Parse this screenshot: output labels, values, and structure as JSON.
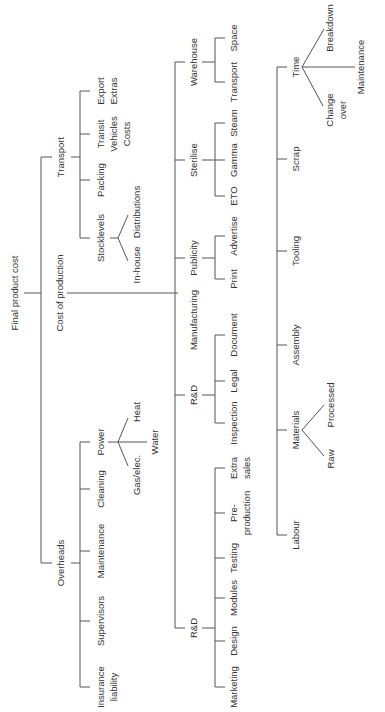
{
  "diagram": {
    "type": "tree",
    "orientation": "rotated-90-ccw",
    "root": "Final product cost",
    "nodes": {
      "root": "Final product cost",
      "cost_of_production": "Cost of production",
      "transport": "Transport",
      "stocklevels": "Stocklevels",
      "in_house": "In-house",
      "distributions": "Distributions",
      "packing": "Packing",
      "transit_vehicles_costs": [
        "Transit",
        "Vehicles",
        "Costs"
      ],
      "export_extras": [
        "Export",
        "Extras"
      ],
      "overheads": "Overheads",
      "insurance_liability": [
        "Insurance",
        "liability"
      ],
      "supervisors": "Supervisors",
      "maintenance": "Maintenance",
      "cleaning": "Cleaning",
      "power": "Power",
      "gas_elec": "Gas/elec.",
      "water": "Water",
      "heat": "Heat",
      "manufacturing": "Manufacturing",
      "warehouse": "Warehouse",
      "wh_transport": "Transport",
      "wh_space": "Space",
      "sterilise": "Sterilise",
      "eto": "ETO",
      "gamma": "Gamma",
      "steam": "Steam",
      "publicity": "Publicity",
      "print": "Print",
      "advertise": "Advertise",
      "rd_upper": "R&D",
      "inspection": "Inspection",
      "legal": "Legal",
      "document": "Document",
      "rd_lower": "R&D",
      "marketing": "Marketing",
      "design": "Design",
      "modules": "Modules",
      "testing": "Testing",
      "pre_production": [
        "Pre-",
        "production"
      ],
      "extra_sales": [
        "Extra",
        "sales"
      ],
      "time": "Time",
      "change_over": [
        "Change",
        "over"
      ],
      "time_maintenance": "Maintenance",
      "breakdown": "Breakdown",
      "scrap": "Scrap",
      "tooling": "Tooling",
      "assembly": "Assembly",
      "materials": "Materials",
      "raw": "Raw",
      "processed": "Processed",
      "labour": "Labour"
    }
  }
}
